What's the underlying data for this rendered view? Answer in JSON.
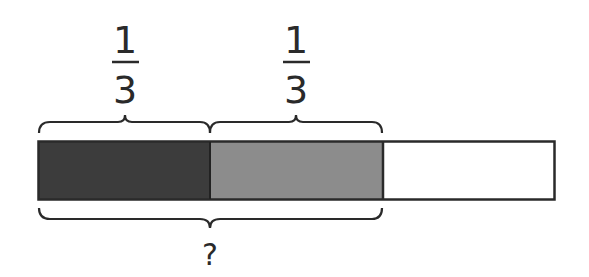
{
  "diagram": {
    "type": "fraction-bar-model",
    "bar": {
      "parts": [
        {
          "label": "part-1",
          "fill": "#3c3c3c",
          "shaded": true
        },
        {
          "label": "part-2",
          "fill": "#8c8c8c",
          "shaded": true
        },
        {
          "label": "part-3",
          "fill": "#ffffff",
          "shaded": false
        }
      ],
      "total_parts": 3,
      "outline": "#2a2a2a"
    },
    "top_labels": [
      {
        "numerator": "1",
        "denominator": "3"
      },
      {
        "numerator": "1",
        "denominator": "3"
      }
    ],
    "bottom_label": "?"
  }
}
